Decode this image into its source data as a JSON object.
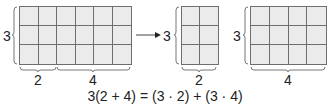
{
  "diagram": {
    "rectangles": [
      {
        "id": "combined",
        "rows": 3,
        "cols": 6,
        "row_label": "3",
        "col_labels": [
          "2",
          "4"
        ]
      },
      {
        "id": "left-part",
        "rows": 3,
        "cols": 2,
        "row_label": "3",
        "col_labels": [
          "2"
        ]
      },
      {
        "id": "right-part",
        "rows": 3,
        "cols": 4,
        "row_label": "3",
        "col_labels": [
          "4"
        ]
      }
    ],
    "labels": {
      "g1_row": "3",
      "g1_col_a": "2",
      "g1_col_b": "4",
      "g2_row": "3",
      "g2_col": "2",
      "g3_row": "3",
      "g3_col": "4"
    },
    "equation": "3(2 + 4) = (3 · 2) + (3 · 4)",
    "colors": {
      "fill": "#ebebeb",
      "line": "#6e6e6e",
      "text": "#222222"
    }
  }
}
